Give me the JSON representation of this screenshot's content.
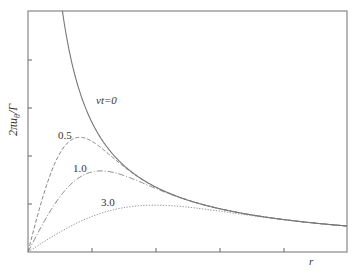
{
  "chart_data": {
    "type": "line",
    "title": "",
    "xlabel": "r",
    "ylabel": "2πu_θ/Γ",
    "xlim": [
      0,
      5
    ],
    "ylim": [
      0,
      5
    ],
    "x_ticks": [
      1,
      2,
      3,
      4
    ],
    "y_ticks": [
      1,
      2,
      3,
      4
    ],
    "tick_labels_shown": false,
    "grid": false,
    "legend": "inline labels",
    "model": "u = C/r * (1 - exp(-r^2 / (4 * s * nu_t)))",
    "constants": {
      "C": 2.7,
      "s": 0.26
    },
    "series": [
      {
        "name": "νt=0",
        "label": "νt=0",
        "style": "solid",
        "nu_t": 0
      },
      {
        "name": "0.5",
        "label": "0.5",
        "style": "dashed",
        "nu_t": 0.5,
        "peak": {
          "r": 0.81,
          "value": 2.2
        }
      },
      {
        "name": "1.0",
        "label": "1.0",
        "style": "dash-dot",
        "nu_t": 1.0,
        "peak": {
          "r": 1.14,
          "value": 1.6
        }
      },
      {
        "name": "3.0",
        "label": "3.0",
        "style": "dotted",
        "nu_t": 3.0,
        "peak": {
          "r": 1.98,
          "value": 0.9
        }
      }
    ]
  },
  "labels": {
    "ylabel_main": "2πu",
    "ylabel_sub": "θ",
    "ylabel_tail": "/Γ",
    "xlabel": "r",
    "vt0": "νt=0",
    "vt05": "0.5",
    "vt10": "1.0",
    "vt30": "3.0"
  }
}
